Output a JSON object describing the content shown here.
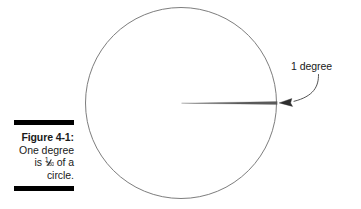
{
  "figure": {
    "canvas": {
      "width": 361,
      "height": 209,
      "background": "#ffffff"
    },
    "caption": {
      "label": "Figure 4-1:",
      "line2": "One degree",
      "line3_prefix": "is ",
      "fraction_numerator": "1",
      "fraction_denominator": "360",
      "line3_suffix": " of a",
      "line4": "circle.",
      "rule_color": "#000000"
    },
    "callout": {
      "label": "1 degree",
      "leader_style": "curved",
      "arrow_direction": "left"
    },
    "diagram": {
      "shape": "circle",
      "stroke_color": "#6b6b6b",
      "center_x": 181,
      "center_y": 103,
      "radius": 96,
      "wedge_label": "1-degree-sector",
      "wedge_angle_degrees": 1,
      "wedge_color": "#555555",
      "arrow_tip_x": 278,
      "arrow_tip_y": 103
    }
  }
}
